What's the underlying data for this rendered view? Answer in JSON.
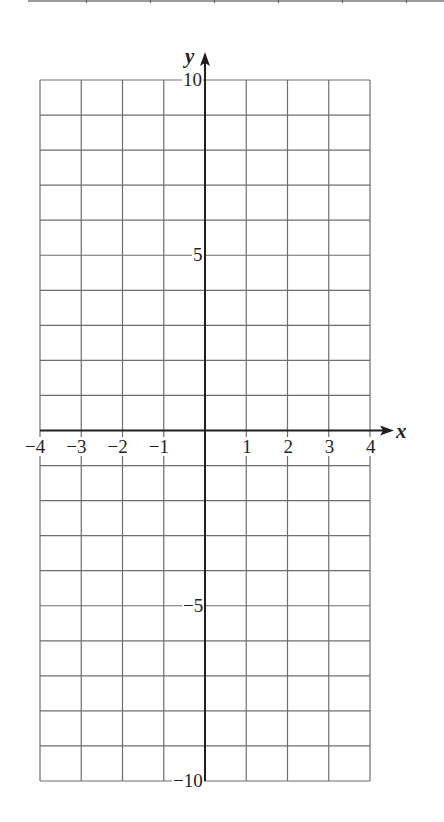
{
  "page": {
    "top_rule_ticks": 6
  },
  "chart_data": {
    "type": "scatter",
    "title": "",
    "xlabel": "x",
    "ylabel": "y",
    "xlim": [
      -4,
      4
    ],
    "ylim": [
      -10,
      10
    ],
    "grid": true,
    "grid_step": {
      "x": 1,
      "y": 1
    },
    "x_ticks": [
      -4,
      -3,
      -2,
      -1,
      1,
      2,
      3,
      4
    ],
    "x_tick_labels": [
      "−4",
      "−3",
      "−2",
      "−1",
      "1",
      "2",
      "3",
      "4"
    ],
    "y_ticks": [
      10,
      5,
      -5,
      -10
    ],
    "y_tick_labels": [
      "10",
      "5",
      "−5",
      "−10"
    ],
    "points": [],
    "legend": null,
    "colors": {
      "grid": "#6d6e71",
      "axis": "#231f20"
    }
  }
}
